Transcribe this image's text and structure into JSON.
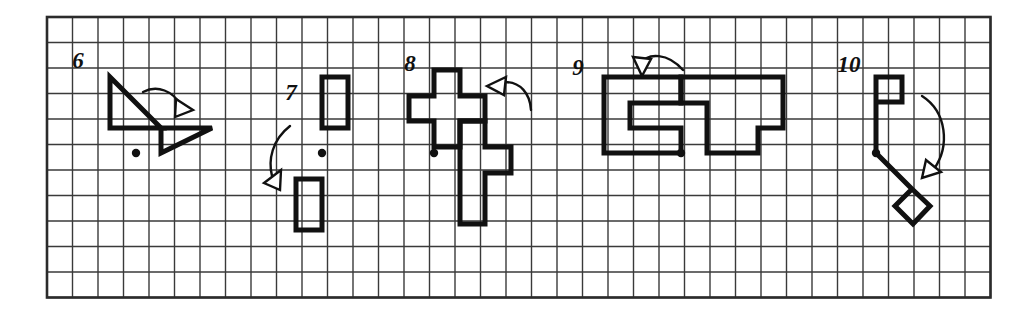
{
  "worksheet": {
    "type": "geometry-rotation-exercises",
    "description": "Row of five grid panels numbered 6 through 10, each showing a pre-image shape, a curved arrow indicating a rotation, a center-of-rotation dot, and the rotated image shape.",
    "grid": {
      "cell_size": 25.5,
      "columns": 37,
      "rows": 11,
      "origin_x": 47,
      "origin_y": 17,
      "line_color": "#3a3a3a",
      "border_color": "#2b2b2b"
    },
    "ink_color": "#111111",
    "problems": [
      {
        "number": "6",
        "label_x": 78,
        "label_y": 68,
        "center_dot": {
          "x": 136,
          "y": 153
        },
        "shapes": [
          {
            "name": "preimage-right-triangle",
            "kind": "polygon",
            "points": "110,77 110,128 161,128"
          },
          {
            "name": "image-right-triangle",
            "kind": "polygon",
            "points": "161,128 212,128 161,153"
          }
        ],
        "arrow": {
          "name": "rotation-arrow",
          "path": "M 143,92 C 158,84 173,92 180,104",
          "head": "176,99 193,110 175,117"
        }
      },
      {
        "number": "7",
        "label_x": 291,
        "label_y": 100,
        "center_dot": {
          "x": 322,
          "y": 153
        },
        "shapes": [
          {
            "name": "preimage-rectangle",
            "kind": "rect",
            "x": 322,
            "y": 77,
            "w": 26,
            "h": 51
          },
          {
            "name": "image-rectangle",
            "kind": "rect",
            "x": 296,
            "y": 179,
            "w": 26,
            "h": 51
          }
        ],
        "arrow": {
          "name": "rotation-arrow",
          "path": "M 290,126 C 272,140 268,160 272,176",
          "head": "281,170 264,183 280,190"
        }
      },
      {
        "number": "8",
        "label_x": 410,
        "label_y": 71,
        "center_dot": {
          "x": 434,
          "y": 153
        },
        "shapes": [
          {
            "name": "preimage-plus-polyomino",
            "kind": "polygon",
            "points": "434,70 460,70 460,96 485,96 485,121 460,121 460,147 434,147 434,121 409,121 409,96 434,96"
          },
          {
            "name": "image-zigzag-polyomino",
            "kind": "polygon",
            "points": "460,121 485,121 485,147 511,147 511,173 485,173 485,224 460,224"
          }
        ],
        "arrow": {
          "name": "rotation-arrow",
          "path": "M 505,82 C 520,82 530,93 531,110",
          "head": "487,86 506,77 504,95"
        }
      },
      {
        "number": "9",
        "label_x": 578,
        "label_y": 75,
        "center_dot": {
          "x": 681,
          "y": 153
        },
        "shapes": [
          {
            "name": "preimage-block-letter-f",
            "kind": "polygon",
            "points": "604,77 681,77 681,103 630,103 630,128 681,128 681,153 604,153"
          },
          {
            "name": "image-block-letter-t",
            "kind": "polygon",
            "points": "681,77 783,77 783,128 758,128 758,153 707,153 707,103 681,103"
          }
        ],
        "arrow": {
          "name": "rotation-arrow",
          "path": "M 683,70 C 668,53 648,52 640,64",
          "head": "633,57 651,59 642,76"
        }
      },
      {
        "number": "10",
        "label_x": 849,
        "label_y": 72,
        "center_dot": {
          "x": 876,
          "y": 153
        },
        "shapes": [
          {
            "name": "preimage-square-with-stem",
            "kind": "path",
            "d": "M 876,153 L 876,77 L 902,77 L 902,102 L 876,102"
          },
          {
            "name": "image-diamond-with-stem",
            "kind": "path",
            "d": "M 876,153 L 912,189 L 895,206 L 913,224 L 930,206 L 912,189"
          }
        ],
        "arrow": {
          "name": "rotation-arrow",
          "path": "M 922,96 C 947,112 950,146 934,169",
          "head": "926,160 941,172 922,178"
        }
      }
    ]
  }
}
